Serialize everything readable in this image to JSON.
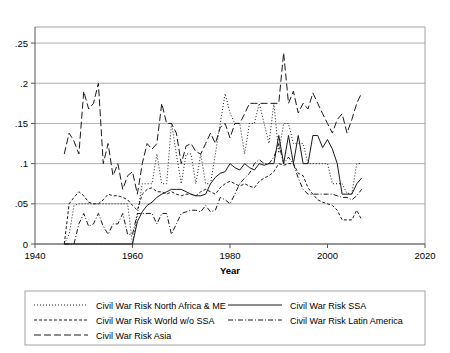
{
  "chart_data": {
    "type": "line",
    "title": "",
    "xlabel": "Year",
    "ylabel": "",
    "xlim": [
      1940,
      2020
    ],
    "ylim": [
      0,
      0.27
    ],
    "grid": true,
    "legend_position": "bottom",
    "xticks": [
      "1940",
      "1960",
      "1980",
      "2000",
      "2020"
    ],
    "xtick_values": [
      1940,
      1960,
      1980,
      2000,
      2020
    ],
    "yticks": [
      "0",
      ".05",
      ".1",
      ".15",
      ".2",
      ".25"
    ],
    "ytick_values": [
      0,
      0.05,
      0.1,
      0.15,
      0.2,
      0.25
    ],
    "series": [
      {
        "name": "Civil War Risk North Africa & ME",
        "style": "dotted",
        "dasharray": "1,2",
        "x": [
          1946,
          1947,
          1948,
          1949,
          1950,
          1951,
          1952,
          1953,
          1954,
          1955,
          1956,
          1957,
          1958,
          1959,
          1960,
          1961,
          1962,
          1963,
          1964,
          1965,
          1966,
          1967,
          1968,
          1969,
          1970,
          1971,
          1972,
          1973,
          1974,
          1975,
          1976,
          1977,
          1978,
          1979,
          1980,
          1981,
          1982,
          1983,
          1984,
          1985,
          1986,
          1987,
          1988,
          1989,
          1990,
          1991,
          1992,
          1993,
          1994,
          1995,
          1996,
          1997,
          1998,
          1999,
          2000,
          2001,
          2002,
          2003,
          2004,
          2005,
          2006,
          2007
        ],
        "values": [
          0.0,
          0.012,
          0.048,
          0.05,
          0.05,
          0.05,
          0.05,
          0.05,
          0.05,
          0.05,
          0.05,
          0.05,
          0.05,
          0.05,
          0.0,
          0.037,
          0.075,
          0.075,
          0.075,
          0.112,
          0.075,
          0.075,
          0.15,
          0.112,
          0.075,
          0.112,
          0.112,
          0.075,
          0.112,
          0.075,
          0.075,
          0.112,
          0.15,
          0.187,
          0.163,
          0.15,
          0.15,
          0.112,
          0.15,
          0.15,
          0.175,
          0.15,
          0.125,
          0.175,
          0.113,
          0.15,
          0.15,
          0.125,
          0.125,
          0.125,
          0.1,
          0.1,
          0.1,
          0.1,
          0.1,
          0.075,
          0.075,
          0.075,
          0.063,
          0.063,
          0.1,
          0.1
        ]
      },
      {
        "name": "Civil War Risk SSA",
        "style": "solid",
        "dasharray": "none",
        "x": [
          1946,
          1947,
          1948,
          1949,
          1950,
          1951,
          1952,
          1953,
          1954,
          1955,
          1956,
          1957,
          1958,
          1959,
          1960,
          1961,
          1962,
          1963,
          1964,
          1965,
          1966,
          1967,
          1968,
          1969,
          1970,
          1971,
          1972,
          1973,
          1974,
          1975,
          1976,
          1977,
          1978,
          1979,
          1980,
          1981,
          1982,
          1983,
          1984,
          1985,
          1986,
          1987,
          1988,
          1989,
          1990,
          1991,
          1992,
          1993,
          1994,
          1995,
          1996,
          1997,
          1998,
          1999,
          2000,
          2001,
          2002,
          2003,
          2004,
          2005,
          2006,
          2007
        ],
        "values": [
          0.0,
          0.0,
          0.0,
          0.0,
          0.0,
          0.0,
          0.0,
          0.0,
          0.0,
          0.0,
          0.0,
          0.0,
          0.0,
          0.0,
          0.0,
          0.028,
          0.04,
          0.048,
          0.052,
          0.058,
          0.062,
          0.065,
          0.068,
          0.068,
          0.068,
          0.065,
          0.062,
          0.06,
          0.06,
          0.062,
          0.075,
          0.083,
          0.088,
          0.09,
          0.1,
          0.095,
          0.092,
          0.1,
          0.095,
          0.092,
          0.1,
          0.098,
          0.1,
          0.1,
          0.135,
          0.1,
          0.135,
          0.1,
          0.135,
          0.1,
          0.1,
          0.135,
          0.135,
          0.12,
          0.13,
          0.118,
          0.1,
          0.062,
          0.062,
          0.062,
          0.075,
          0.082
        ]
      },
      {
        "name": "Civil War Risk World w/o SSA",
        "style": "dashed",
        "dasharray": "3,2",
        "x": [
          1946,
          1947,
          1948,
          1949,
          1950,
          1951,
          1952,
          1953,
          1954,
          1955,
          1956,
          1957,
          1958,
          1959,
          1960,
          1961,
          1962,
          1963,
          1964,
          1965,
          1966,
          1967,
          1968,
          1969,
          1970,
          1971,
          1972,
          1973,
          1974,
          1975,
          1976,
          1977,
          1978,
          1979,
          1980,
          1981,
          1982,
          1983,
          1984,
          1985,
          1986,
          1987,
          1988,
          1989,
          1990,
          1991,
          1992,
          1993,
          1994,
          1995,
          1996,
          1997,
          1998,
          1999,
          2000,
          2001,
          2002,
          2003,
          2004,
          2005,
          2006,
          2007
        ],
        "values": [
          0.0,
          0.05,
          0.058,
          0.065,
          0.06,
          0.052,
          0.05,
          0.05,
          0.055,
          0.062,
          0.06,
          0.06,
          0.058,
          0.055,
          0.048,
          0.042,
          0.062,
          0.068,
          0.07,
          0.065,
          0.065,
          0.062,
          0.065,
          0.062,
          0.06,
          0.062,
          0.062,
          0.06,
          0.065,
          0.068,
          0.065,
          0.062,
          0.07,
          0.075,
          0.078,
          0.075,
          0.072,
          0.075,
          0.072,
          0.07,
          0.078,
          0.082,
          0.085,
          0.09,
          0.1,
          0.098,
          0.1,
          0.1,
          0.088,
          0.085,
          0.07,
          0.062,
          0.055,
          0.052,
          0.05,
          0.048,
          0.042,
          0.03,
          0.03,
          0.03,
          0.042,
          0.03
        ]
      },
      {
        "name": "Civil War Risk Latin America",
        "style": "dashdot",
        "dasharray": "5,2,1,2",
        "x": [
          1946,
          1947,
          1948,
          1949,
          1950,
          1951,
          1952,
          1953,
          1954,
          1955,
          1956,
          1957,
          1958,
          1959,
          1960,
          1961,
          1962,
          1963,
          1964,
          1965,
          1966,
          1967,
          1968,
          1969,
          1970,
          1971,
          1972,
          1973,
          1974,
          1975,
          1976,
          1977,
          1978,
          1979,
          1980,
          1981,
          1982,
          1983,
          1984,
          1985,
          1986,
          1987,
          1988,
          1989,
          1990,
          1991,
          1992,
          1993,
          1994,
          1995,
          1996,
          1997,
          1998,
          1999,
          2000,
          2001,
          2002,
          2003,
          2004,
          2005,
          2006,
          2007
        ],
        "values": [
          0.0,
          0.0,
          0.0,
          0.025,
          0.038,
          0.022,
          0.025,
          0.038,
          0.022,
          0.012,
          0.025,
          0.025,
          0.038,
          0.012,
          0.012,
          0.038,
          0.038,
          0.038,
          0.038,
          0.025,
          0.038,
          0.038,
          0.012,
          0.025,
          0.038,
          0.04,
          0.042,
          0.042,
          0.04,
          0.048,
          0.04,
          0.042,
          0.058,
          0.055,
          0.05,
          0.062,
          0.075,
          0.082,
          0.088,
          0.1,
          0.105,
          0.1,
          0.1,
          0.108,
          0.125,
          0.1,
          0.108,
          0.1,
          0.082,
          0.068,
          0.062,
          0.062,
          0.062,
          0.062,
          0.062,
          0.062,
          0.06,
          0.058,
          0.058,
          0.055,
          0.06,
          0.068
        ]
      },
      {
        "name": "Civil War Risk Asia",
        "style": "longdash",
        "dasharray": "7,3",
        "x": [
          1946,
          1947,
          1948,
          1949,
          1950,
          1951,
          1952,
          1953,
          1954,
          1955,
          1956,
          1957,
          1958,
          1959,
          1960,
          1961,
          1962,
          1963,
          1964,
          1965,
          1966,
          1967,
          1968,
          1969,
          1970,
          1971,
          1972,
          1973,
          1974,
          1975,
          1976,
          1977,
          1978,
          1979,
          1980,
          1981,
          1982,
          1983,
          1984,
          1985,
          1986,
          1987,
          1988,
          1989,
          1990,
          1991,
          1992,
          1993,
          1994,
          1995,
          1996,
          1997,
          1998,
          1999,
          2000,
          2001,
          2002,
          2003,
          2004,
          2005,
          2006,
          2007
        ],
        "values": [
          0.112,
          0.138,
          0.128,
          0.112,
          0.19,
          0.168,
          0.175,
          0.2,
          0.1,
          0.125,
          0.085,
          0.1,
          0.068,
          0.085,
          0.09,
          0.062,
          0.1,
          0.125,
          0.118,
          0.125,
          0.175,
          0.15,
          0.15,
          0.138,
          0.1,
          0.122,
          0.125,
          0.115,
          0.112,
          0.125,
          0.138,
          0.125,
          0.145,
          0.15,
          0.132,
          0.15,
          0.15,
          0.162,
          0.175,
          0.175,
          0.175,
          0.175,
          0.175,
          0.175,
          0.175,
          0.238,
          0.175,
          0.19,
          0.163,
          0.175,
          0.168,
          0.188,
          0.175,
          0.162,
          0.15,
          0.138,
          0.155,
          0.162,
          0.138,
          0.155,
          0.175,
          0.188
        ]
      }
    ]
  },
  "legend": {
    "entries": [
      {
        "label": "Civil War Risk North Africa & ME",
        "style": "dotted",
        "dasharray": "1,2",
        "column": 0,
        "row": 0
      },
      {
        "label": "Civil War Risk SSA",
        "style": "solid",
        "dasharray": "none",
        "column": 1,
        "row": 0
      },
      {
        "label": "Civil War Risk World w/o SSA",
        "style": "dashed",
        "dasharray": "3,2",
        "column": 0,
        "row": 1
      },
      {
        "label": "Civil War Risk Latin America",
        "style": "dashdot",
        "dasharray": "5,2,1,2",
        "column": 1,
        "row": 1
      },
      {
        "label": "Civil War Risk Asia",
        "style": "longdash",
        "dasharray": "7,3",
        "column": 0,
        "row": 2
      }
    ]
  },
  "colors": {
    "background": "#ffffff",
    "line": "#1a1a1a",
    "grid": "#8c8c8c",
    "axis": "#555555",
    "text": "#000000"
  }
}
